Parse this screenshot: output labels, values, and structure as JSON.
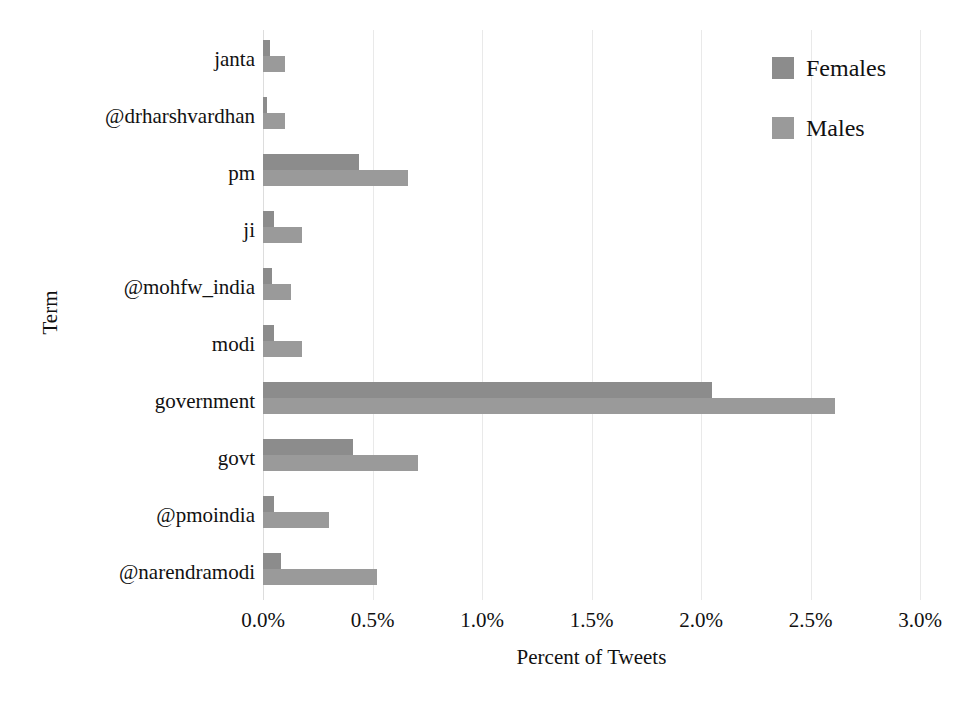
{
  "chart_data": {
    "type": "bar",
    "orientation": "horizontal",
    "title": "",
    "xlabel": "Percent of Tweets",
    "ylabel": "Term",
    "xlim": [
      0,
      3.0
    ],
    "xticks": [
      0.0,
      0.5,
      1.0,
      1.5,
      2.0,
      2.5,
      3.0
    ],
    "xtick_labels": [
      "0.0%",
      "0.5%",
      "1.0%",
      "1.5%",
      "2.0%",
      "2.5%",
      "3.0%"
    ],
    "grid": "vertical",
    "legend_position": "top-right",
    "categories": [
      "janta",
      "@drharshvardhan",
      "pm",
      "ji",
      "@mohfw_india",
      "modi",
      "government",
      "govt",
      "@pmoindia",
      "@narendramodi"
    ],
    "series": [
      {
        "name": "Females",
        "color": "#8c8c8c",
        "values": [
          0.03,
          0.02,
          0.44,
          0.05,
          0.04,
          0.05,
          2.05,
          0.41,
          0.05,
          0.08
        ]
      },
      {
        "name": "Males",
        "color": "#9a9a9a",
        "values": [
          0.1,
          0.1,
          0.66,
          0.18,
          0.13,
          0.18,
          2.61,
          0.71,
          0.3,
          0.52
        ]
      }
    ]
  },
  "legend": {
    "items": [
      {
        "label": "Females",
        "color": "#8c8c8c"
      },
      {
        "label": "Males",
        "color": "#9a9a9a"
      }
    ]
  },
  "axes": {
    "x_title": "Percent of Tweets",
    "y_title": "Term"
  }
}
